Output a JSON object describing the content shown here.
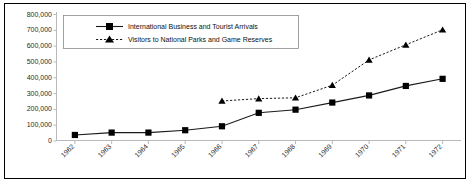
{
  "chart_data": {
    "type": "line",
    "title": "",
    "xlabel": "",
    "ylabel": "",
    "grid": false,
    "legend_position": "top-left-inset",
    "ylim": [
      0,
      800000
    ],
    "ytick_labels": [
      "800,000",
      "700,000",
      "600,000",
      "500,000",
      "400,000",
      "300,000",
      "200,000",
      "100,000",
      "0"
    ],
    "ytick_values": [
      800000,
      700000,
      600000,
      500000,
      400000,
      300000,
      200000,
      100000,
      0
    ],
    "categories": [
      "1962",
      "1963",
      "1964",
      "1965",
      "1966",
      "1967",
      "1968",
      "1969",
      "1970",
      "1971",
      "1972"
    ],
    "series": [
      {
        "name": "International Business and Tourist Arrivals",
        "marker": "square",
        "line_style": "solid",
        "color": "#1a1a1a",
        "values": [
          35000,
          50000,
          50000,
          65000,
          90000,
          175000,
          195000,
          240000,
          285000,
          345000,
          390000
        ]
      },
      {
        "name": "Visitors to National Parks and Game Reserves",
        "marker": "triangle",
        "line_style": "dotted",
        "color": "#1a1a1a",
        "values": [
          null,
          null,
          null,
          null,
          250000,
          265000,
          270000,
          350000,
          510000,
          605000,
          700000
        ]
      }
    ]
  },
  "legend": {
    "entries": [
      {
        "label": "International Business and Tourist Arrivals"
      },
      {
        "label": "Visitors to National Parks and Game Reserves"
      }
    ]
  }
}
